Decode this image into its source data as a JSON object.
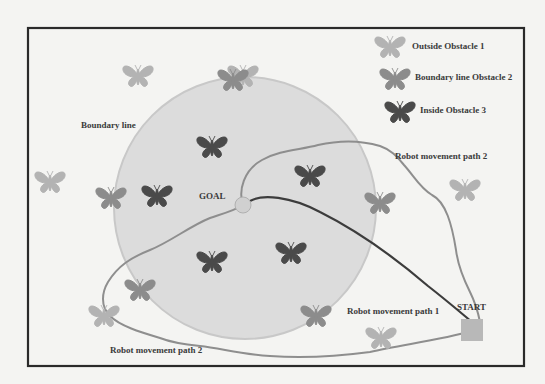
{
  "diagram": {
    "frame": {
      "x": 28,
      "y": 28,
      "width": 496,
      "height": 338,
      "border_color": "#2a2a2a"
    },
    "boundary_circle": {
      "cx": 245,
      "cy": 208,
      "r": 131,
      "fill": "#dcdcdc",
      "stroke": "#c8c8c8"
    },
    "colors": {
      "outside": "#b3b3b3",
      "boundary": "#8c8c8c",
      "inside": "#4a4a4a",
      "path1": "#3c3c3c",
      "path2": "#8e8e8e"
    },
    "legend": [
      {
        "type": "outside",
        "label": "Outside Obstacle 1"
      },
      {
        "type": "boundary",
        "label": "Boundary line Obstacle 2"
      },
      {
        "type": "inside",
        "label": "Inside Obstacle 3"
      }
    ],
    "labels": {
      "boundary_line": "Boundary line",
      "goal": "GOAL",
      "start": "START",
      "path1": "Robot movement path 1",
      "path2_top": "Robot movement path 2",
      "path2_bottom": "Robot movement path 2"
    },
    "goal": {
      "cx": 243,
      "cy": 205,
      "r": 8,
      "fill": "#d0d0d0"
    },
    "start": {
      "x": 472,
      "y": 322,
      "size": 22,
      "fill": "#b8b8b8"
    },
    "obstacles": [
      {
        "type": "outside",
        "x": 138,
        "y": 76
      },
      {
        "type": "outside",
        "x": 243,
        "y": 76
      },
      {
        "type": "boundary",
        "x": 233,
        "y": 80
      },
      {
        "type": "outside",
        "x": 50,
        "y": 182
      },
      {
        "type": "boundary",
        "x": 111,
        "y": 198
      },
      {
        "type": "inside",
        "x": 157,
        "y": 196
      },
      {
        "type": "inside",
        "x": 212,
        "y": 147
      },
      {
        "type": "inside",
        "x": 310,
        "y": 176
      },
      {
        "type": "boundary",
        "x": 380,
        "y": 203
      },
      {
        "type": "outside",
        "x": 465,
        "y": 190
      },
      {
        "type": "inside",
        "x": 212,
        "y": 262
      },
      {
        "type": "inside",
        "x": 291,
        "y": 253
      },
      {
        "type": "boundary",
        "x": 140,
        "y": 290
      },
      {
        "type": "outside",
        "x": 104,
        "y": 316
      },
      {
        "type": "boundary",
        "x": 316,
        "y": 316
      },
      {
        "type": "outside",
        "x": 381,
        "y": 338
      }
    ]
  }
}
